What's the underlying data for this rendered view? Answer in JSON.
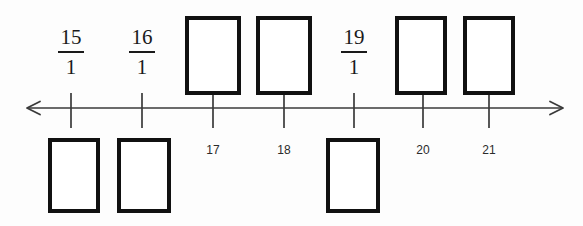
{
  "figure": {
    "background_color": "#fdfdfd",
    "ink_color": "#111111",
    "axis_color": "#3a3a3a"
  },
  "number_line": {
    "y": 108,
    "x_start": 27,
    "x_end": 563,
    "left_arrow": true,
    "right_arrow": true,
    "tick_up": 15,
    "tick_down": 20,
    "ticks": [
      {
        "x": 71,
        "value": "15"
      },
      {
        "x": 142,
        "value": "16"
      },
      {
        "x": 213,
        "value": "17"
      },
      {
        "x": 284,
        "value": "18"
      },
      {
        "x": 354,
        "value": "19"
      },
      {
        "x": 423,
        "value": "20"
      },
      {
        "x": 489,
        "value": "21"
      }
    ]
  },
  "fractions": [
    {
      "numerator": "15",
      "denominator": "1",
      "center_x": 71,
      "top": 27,
      "tick_value": "15"
    },
    {
      "numerator": "16",
      "denominator": "1",
      "center_x": 142,
      "top": 27,
      "tick_value": "16"
    },
    {
      "numerator": "19",
      "denominator": "1",
      "center_x": 354,
      "top": 27,
      "tick_value": "19"
    }
  ],
  "tick_labels": [
    {
      "text": "17",
      "center_x": 213,
      "top": 143
    },
    {
      "text": "18",
      "center_x": 284,
      "top": 143
    },
    {
      "text": "20",
      "center_x": 423,
      "top": 143
    },
    {
      "text": "21",
      "center_x": 489,
      "top": 143
    }
  ],
  "answer_boxes": {
    "above_line": [
      {
        "id": "box-above-17",
        "left": 185,
        "top": 16,
        "width": 56,
        "height": 79,
        "tick_value": "17",
        "content": ""
      },
      {
        "id": "box-above-18",
        "left": 256,
        "top": 16,
        "width": 56,
        "height": 79,
        "tick_value": "18",
        "content": ""
      },
      {
        "id": "box-above-20",
        "left": 395,
        "top": 16,
        "width": 52,
        "height": 79,
        "tick_value": "20",
        "content": ""
      },
      {
        "id": "box-above-21",
        "left": 463,
        "top": 16,
        "width": 52,
        "height": 79,
        "tick_value": "21",
        "content": ""
      }
    ],
    "below_line": [
      {
        "id": "box-below-1",
        "left": 48,
        "top": 138,
        "width": 52,
        "height": 75,
        "content": ""
      },
      {
        "id": "box-below-2",
        "left": 117,
        "top": 138,
        "width": 54,
        "height": 75,
        "content": ""
      },
      {
        "id": "box-below-3",
        "left": 326,
        "top": 138,
        "width": 54,
        "height": 75,
        "content": ""
      }
    ]
  }
}
